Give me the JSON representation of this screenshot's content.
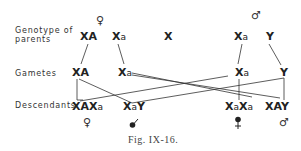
{
  "row_labels": {
    "parents": [
      "Genotype of",
      "parents"
    ],
    "gametes": "Gametes",
    "descendants": "Descendants"
  },
  "parents": {
    "female_symbol": "♀",
    "male_symbol": "♂",
    "cross_symbol": "X",
    "female": [
      {
        "main": "X",
        "allele": "A"
      },
      {
        "main": "X",
        "allele": "a"
      }
    ],
    "male": [
      {
        "main": "X",
        "allele": "a"
      },
      {
        "main": "Y",
        "allele": ""
      }
    ]
  },
  "gametes": [
    {
      "main": "X",
      "allele": "A",
      "from": "female"
    },
    {
      "main": "X",
      "allele": "a",
      "from": "female"
    },
    {
      "main": "X",
      "allele": "a",
      "from": "male"
    },
    {
      "main": "Y",
      "allele": "",
      "from": "male"
    }
  ],
  "descendants": [
    {
      "genotype": [
        "X",
        "A",
        "X",
        "a"
      ],
      "sex_symbol": "♀",
      "sex": "female carrier"
    },
    {
      "genotype": [
        "X",
        "a",
        "Y"
      ],
      "sex_symbol": "♂",
      "sex": "affected male"
    },
    {
      "genotype": [
        "X",
        "a",
        "X",
        "a"
      ],
      "sex_symbol": "♀",
      "sex": "affected female"
    },
    {
      "genotype": [
        "X",
        "A",
        "Y"
      ],
      "sex_symbol": "♂",
      "sex": "normal male"
    }
  ],
  "connections": [
    {
      "from": "parent-XA",
      "to": "gamete-XA"
    },
    {
      "from": "parent-Xa-female",
      "to": "gamete-Xa-female"
    },
    {
      "from": "parent-Xa-male",
      "to": "gamete-Xa-male"
    },
    {
      "from": "parent-Y",
      "to": "gamete-Y"
    },
    {
      "from": "gamete-XA",
      "to": "XAXa"
    },
    {
      "from": "gamete-XA",
      "to": "XAY"
    },
    {
      "from": "gamete-Xa-female",
      "to": "XaY"
    },
    {
      "from": "gamete-Xa-female",
      "to": "XaXa"
    },
    {
      "from": "gamete-Xa-male",
      "to": "XAXa"
    },
    {
      "from": "gamete-Xa-male",
      "to": "XaXa"
    },
    {
      "from": "gamete-Y",
      "to": "XaY"
    },
    {
      "from": "gamete-Y",
      "to": "XAY"
    }
  ],
  "caption": "Fig. IX-16."
}
